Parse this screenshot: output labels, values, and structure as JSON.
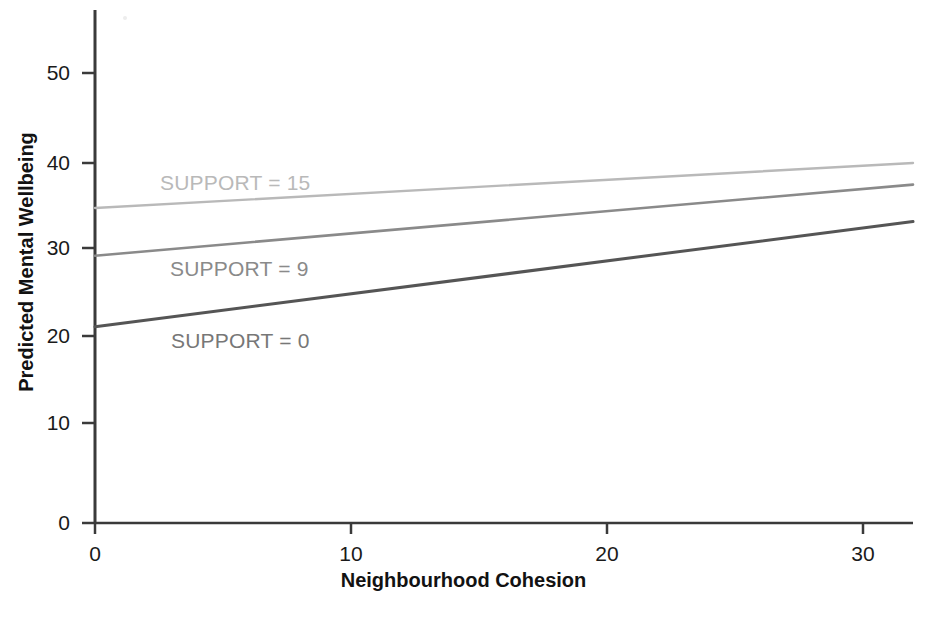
{
  "chart_data": {
    "type": "line",
    "title": "",
    "xlabel": "Neighbourhood Cohesion",
    "ylabel": "Predicted Mental Wellbeing",
    "xlim": [
      0,
      32
    ],
    "ylim": [
      0,
      55
    ],
    "xticks": [
      0,
      10,
      20,
      30
    ],
    "xtick_labels": [
      "0",
      "10",
      "20",
      "30"
    ],
    "yticks": [
      0,
      10,
      20,
      30,
      40,
      50
    ],
    "ytick_labels": [
      "0",
      "10",
      "20",
      "30",
      "40",
      "50"
    ],
    "grid": false,
    "legend": "inline-annotations",
    "x": [
      0,
      32
    ],
    "series": [
      {
        "name": "SUPPORT = 15",
        "label": "SUPPORT = 15",
        "values": [
          35.0,
          40.0
        ],
        "color": "#b9b9b9",
        "label_x": 15.0,
        "label_y": 38.0
      },
      {
        "name": "SUPPORT = 9",
        "label": "SUPPORT = 9",
        "values": [
          29.7,
          37.6
        ],
        "color": "#8a8a8a",
        "label_x": 15.0,
        "label_y": 28.5
      },
      {
        "name": "SUPPORT = 0",
        "label": "SUPPORT = 0",
        "values": [
          21.8,
          33.5
        ],
        "color": "#555555",
        "label_x": 15.0,
        "label_y": 20.4
      }
    ],
    "axis_color": "#3a3a3a",
    "tick_label_color": "#1a1a1a",
    "background": "#ffffff"
  }
}
